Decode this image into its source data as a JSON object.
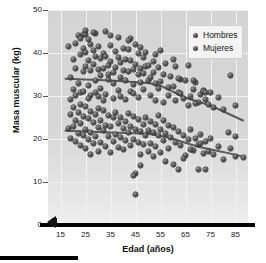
{
  "chart_data": {
    "type": "scatter",
    "title": "",
    "xlabel": "Edad (años)",
    "ylabel": "Masa muscular (kg)",
    "xlim": [
      10,
      90
    ],
    "ylim": [
      0,
      50
    ],
    "xticks": [
      15,
      25,
      35,
      45,
      55,
      65,
      75,
      85
    ],
    "yticks": [
      0,
      10,
      20,
      30,
      40,
      50
    ],
    "grid": true,
    "legend_position": "top-right",
    "axis_break": true,
    "marker_color": "#3a3a3a",
    "plot_background": "#d6d6d6",
    "gridline_color": "#f2f2f2",
    "series": [
      {
        "name": "Hombres",
        "marker": "circle",
        "trendline": {
          "points": [
            [
              17,
              34.0
            ],
            [
              35,
              33.6
            ],
            [
              50,
              33.0
            ],
            [
              55,
              32.4
            ],
            [
              65,
              29.6
            ],
            [
              75,
              27.8
            ],
            [
              88,
              24.3
            ]
          ],
          "color": "#5a5a5a"
        },
        "points": [
          [
            18,
            41.6
          ],
          [
            20,
            38.5
          ],
          [
            21,
            42.2
          ],
          [
            22,
            44.0
          ],
          [
            23,
            43.3
          ],
          [
            23,
            39.6
          ],
          [
            24,
            44.2
          ],
          [
            24,
            41.0
          ],
          [
            25,
            44.3
          ],
          [
            25,
            40.2
          ],
          [
            25,
            36.8
          ],
          [
            26,
            43.1
          ],
          [
            26,
            38.2
          ],
          [
            27,
            42.0
          ],
          [
            27,
            35.9
          ],
          [
            28,
            40.6
          ],
          [
            28,
            37.3
          ],
          [
            29,
            44.6
          ],
          [
            29,
            39.1
          ],
          [
            30,
            41.4
          ],
          [
            30,
            36.2
          ],
          [
            31,
            38.8
          ],
          [
            31,
            34.7
          ],
          [
            32,
            40.0
          ],
          [
            32,
            36.5
          ],
          [
            33,
            45.0
          ],
          [
            33,
            39.3
          ],
          [
            34,
            37.0
          ],
          [
            34,
            33.8
          ],
          [
            35,
            41.7
          ],
          [
            35,
            38.1
          ],
          [
            36,
            35.4
          ],
          [
            36,
            32.9
          ],
          [
            37,
            40.3
          ],
          [
            37,
            36.7
          ],
          [
            38,
            43.7
          ],
          [
            38,
            39.0
          ],
          [
            39,
            34.2
          ],
          [
            39,
            37.8
          ],
          [
            40,
            41.1
          ],
          [
            40,
            36.0
          ],
          [
            41,
            38.6
          ],
          [
            41,
            33.5
          ],
          [
            42,
            40.8
          ],
          [
            42,
            35.7
          ],
          [
            43,
            43.4
          ],
          [
            43,
            38.3
          ],
          [
            44,
            36.1
          ],
          [
            44,
            32.6
          ],
          [
            45,
            41.9
          ],
          [
            45,
            37.4
          ],
          [
            46,
            39.8
          ],
          [
            46,
            34.9
          ],
          [
            47,
            36.3
          ],
          [
            47,
            33.1
          ],
          [
            48,
            38.9
          ],
          [
            48,
            35.2
          ],
          [
            49,
            40.1
          ],
          [
            49,
            36.8
          ],
          [
            50,
            33.7
          ],
          [
            50,
            37.2
          ],
          [
            51,
            34.4
          ],
          [
            52,
            38.0
          ],
          [
            52,
            35.5
          ],
          [
            53,
            32.8
          ],
          [
            54,
            36.6
          ],
          [
            55,
            40.5
          ],
          [
            55,
            33.3
          ],
          [
            56,
            35.0
          ],
          [
            57,
            37.6
          ],
          [
            58,
            31.9
          ],
          [
            59,
            34.6
          ],
          [
            60,
            38.4
          ],
          [
            60,
            32.2
          ],
          [
            61,
            36.9
          ],
          [
            62,
            30.8
          ],
          [
            63,
            33.9
          ],
          [
            64,
            29.4
          ],
          [
            65,
            33.5
          ],
          [
            66,
            37.1
          ],
          [
            67,
            29.9
          ],
          [
            68,
            31.6
          ],
          [
            69,
            33.2
          ],
          [
            70,
            28.6
          ],
          [
            71,
            30.4
          ],
          [
            72,
            31.2
          ],
          [
            73,
            29.1
          ],
          [
            74,
            28.0
          ],
          [
            75,
            30.9
          ],
          [
            76,
            27.4
          ],
          [
            78,
            29.7
          ],
          [
            80,
            26.8
          ],
          [
            83,
            34.7
          ],
          [
            85,
            27.9
          ],
          [
            19,
            34.3
          ],
          [
            20,
            31.5
          ],
          [
            21,
            36.4
          ],
          [
            22,
            33.0
          ],
          [
            23,
            30.7
          ],
          [
            24,
            35.8
          ],
          [
            26,
            32.4
          ],
          [
            27,
            30.1
          ],
          [
            29,
            33.6
          ],
          [
            30,
            29.8
          ],
          [
            31,
            31.8
          ],
          [
            33,
            30.3
          ],
          [
            34,
            35.1
          ],
          [
            36,
            29.5
          ],
          [
            38,
            31.3
          ],
          [
            39,
            30.0
          ],
          [
            41,
            29.2
          ],
          [
            43,
            31.0
          ],
          [
            44,
            30.5
          ],
          [
            46,
            29.7
          ],
          [
            48,
            31.4
          ],
          [
            51,
            30.2
          ],
          [
            53,
            29.0
          ],
          [
            54,
            31.7
          ],
          [
            56,
            28.4
          ],
          [
            58,
            30.1
          ],
          [
            61,
            28.9
          ],
          [
            63,
            30.6
          ],
          [
            66,
            27.7
          ],
          [
            69,
            28.2
          ],
          [
            72,
            31.1
          ],
          [
            73,
            30.9
          ],
          [
            25,
            45.2
          ],
          [
            28,
            44.8
          ],
          [
            35,
            44.1
          ],
          [
            42,
            42.8
          ],
          [
            47,
            41.3
          ],
          [
            53,
            39.7
          ],
          [
            62,
            34.0
          ],
          [
            68,
            33.6
          ]
        ]
      },
      {
        "name": "Mujeres",
        "marker": "circle",
        "trendline": {
          "points": [
            [
              17,
              21.9
            ],
            [
              35,
              21.5
            ],
            [
              50,
              21.2
            ],
            [
              58,
              20.4
            ],
            [
              70,
              18.2
            ],
            [
              80,
              17.0
            ],
            [
              88,
              15.9
            ]
          ],
          "color": "#5a5a5a"
        },
        "points": [
          [
            18,
            22.4
          ],
          [
            19,
            25.6
          ],
          [
            19,
            20.1
          ],
          [
            20,
            27.3
          ],
          [
            20,
            22.9
          ],
          [
            21,
            24.2
          ],
          [
            21,
            19.4
          ],
          [
            22,
            26.1
          ],
          [
            22,
            21.3
          ],
          [
            23,
            28.0
          ],
          [
            23,
            23.5
          ],
          [
            23,
            18.6
          ],
          [
            24,
            25.2
          ],
          [
            24,
            20.8
          ],
          [
            25,
            27.6
          ],
          [
            25,
            22.1
          ],
          [
            25,
            17.9
          ],
          [
            26,
            24.7
          ],
          [
            26,
            19.8
          ],
          [
            27,
            26.4
          ],
          [
            27,
            21.6
          ],
          [
            27,
            16.3
          ],
          [
            28,
            23.9
          ],
          [
            28,
            18.9
          ],
          [
            29,
            25.8
          ],
          [
            29,
            20.5
          ],
          [
            30,
            27.0
          ],
          [
            30,
            22.6
          ],
          [
            30,
            17.2
          ],
          [
            31,
            24.3
          ],
          [
            31,
            19.1
          ],
          [
            32,
            26.7
          ],
          [
            32,
            21.9
          ],
          [
            33,
            23.2
          ],
          [
            33,
            18.3
          ],
          [
            34,
            25.4
          ],
          [
            34,
            20.6
          ],
          [
            35,
            22.8
          ],
          [
            35,
            16.8
          ],
          [
            36,
            24.9
          ],
          [
            36,
            19.5
          ],
          [
            37,
            26.2
          ],
          [
            37,
            21.1
          ],
          [
            38,
            23.6
          ],
          [
            38,
            18.0
          ],
          [
            39,
            25.0
          ],
          [
            39,
            20.3
          ],
          [
            40,
            22.5
          ],
          [
            40,
            17.5
          ],
          [
            41,
            24.1
          ],
          [
            41,
            19.7
          ],
          [
            42,
            26.0
          ],
          [
            42,
            21.4
          ],
          [
            43,
            23.0
          ],
          [
            43,
            18.4
          ],
          [
            44,
            25.3
          ],
          [
            44,
            20.0
          ],
          [
            45,
            22.2
          ],
          [
            45,
            12.0
          ],
          [
            45,
            7.0
          ],
          [
            46,
            24.5
          ],
          [
            46,
            19.3
          ],
          [
            47,
            21.8
          ],
          [
            47,
            16.5
          ],
          [
            48,
            23.4
          ],
          [
            48,
            18.7
          ],
          [
            49,
            25.1
          ],
          [
            49,
            20.9
          ],
          [
            50,
            22.0
          ],
          [
            50,
            17.1
          ],
          [
            51,
            24.0
          ],
          [
            51,
            19.0
          ],
          [
            52,
            21.5
          ],
          [
            52,
            15.9
          ],
          [
            53,
            23.3
          ],
          [
            53,
            18.2
          ],
          [
            54,
            20.7
          ],
          [
            54,
            25.5
          ],
          [
            55,
            22.3
          ],
          [
            55,
            16.9
          ],
          [
            56,
            24.4
          ],
          [
            56,
            19.6
          ],
          [
            57,
            21.2
          ],
          [
            58,
            23.1
          ],
          [
            58,
            17.8
          ],
          [
            59,
            20.4
          ],
          [
            60,
            22.7
          ],
          [
            60,
            14.0
          ],
          [
            61,
            19.2
          ],
          [
            62,
            21.7
          ],
          [
            62,
            13.0
          ],
          [
            63,
            18.5
          ],
          [
            64,
            20.8
          ],
          [
            65,
            16.2
          ],
          [
            66,
            19.9
          ],
          [
            67,
            22.1
          ],
          [
            68,
            17.3
          ],
          [
            69,
            20.2
          ],
          [
            70,
            13.0
          ],
          [
            70,
            18.8
          ],
          [
            71,
            21.0
          ],
          [
            72,
            16.6
          ],
          [
            73,
            13.0
          ],
          [
            73,
            19.4
          ],
          [
            74,
            17.0
          ],
          [
            75,
            20.1
          ],
          [
            76,
            16.4
          ],
          [
            78,
            18.3
          ],
          [
            80,
            15.2
          ],
          [
            82,
            21.4
          ],
          [
            83,
            17.9
          ],
          [
            85,
            20.6
          ],
          [
            85,
            16.0
          ],
          [
            88,
            15.8
          ],
          [
            19,
            29.1
          ],
          [
            21,
            30.2
          ],
          [
            24,
            31.0
          ],
          [
            26,
            29.4
          ],
          [
            29,
            30.8
          ],
          [
            32,
            29.0
          ],
          [
            44,
            11.5
          ],
          [
            47,
            13.9
          ],
          [
            57,
            14.8
          ],
          [
            64,
            15.5
          ],
          [
            67,
            17.6
          ],
          [
            71,
            19.0
          ]
        ]
      }
    ]
  },
  "legend": {
    "items": [
      {
        "label": "Hombres"
      },
      {
        "label": "Mujeres"
      }
    ]
  },
  "axis": {
    "y_title": "Masa muscular (kg)",
    "x_title": "Edad (años)",
    "y_tick_labels": [
      "50",
      "40",
      "30",
      "20",
      "10",
      "0"
    ],
    "x_tick_labels": [
      "15",
      "25",
      "35",
      "45",
      "55",
      "65",
      "75",
      "85"
    ]
  }
}
